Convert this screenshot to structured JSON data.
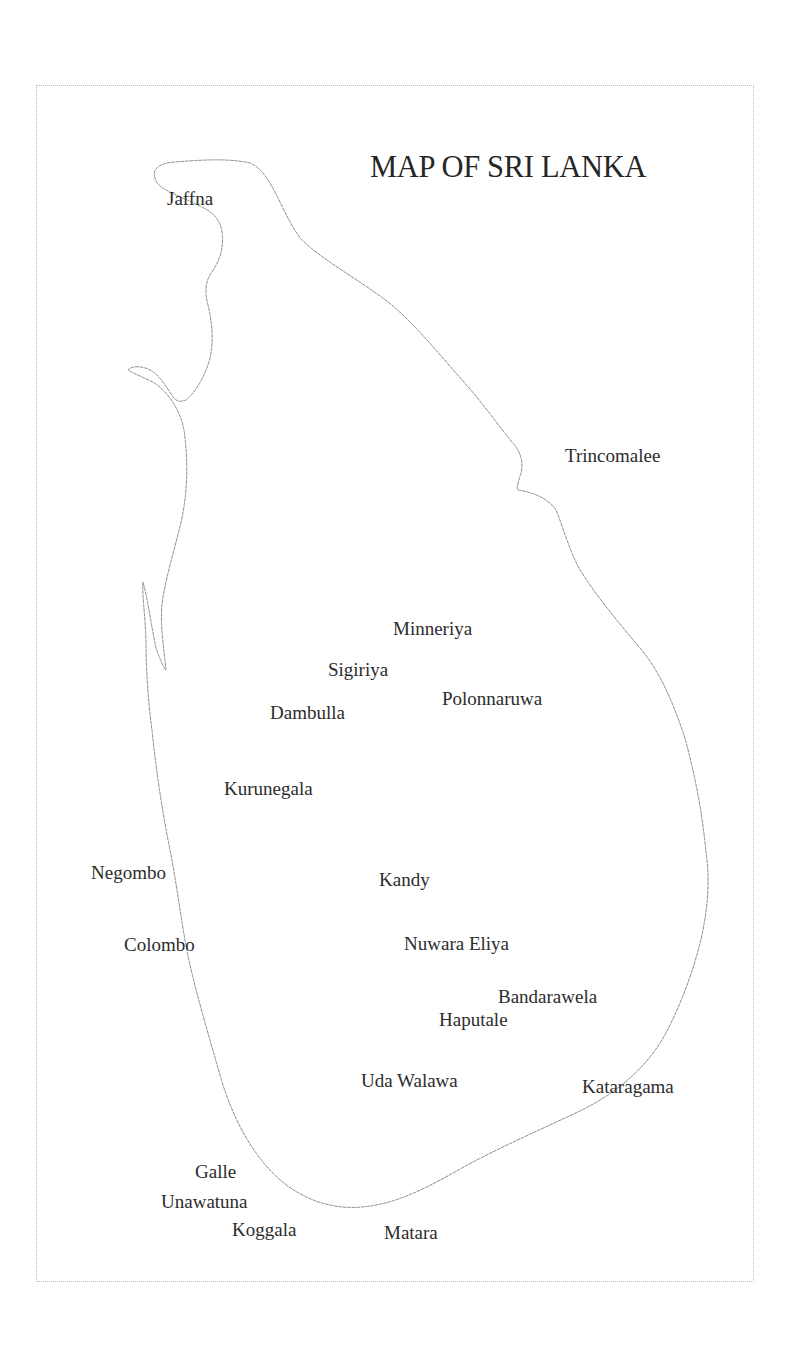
{
  "map": {
    "title": "MAP OF SRI LANKA",
    "colors": {
      "background": "#ffffff",
      "frame": "#b9b9b9",
      "coastline": "#8e8e8e",
      "text": "#2c2c2c"
    },
    "places": [
      {
        "id": "jaffna",
        "name": "Jaffna",
        "x": 167,
        "y": 189
      },
      {
        "id": "trincomalee",
        "name": "Trincomalee",
        "x": 565,
        "y": 446
      },
      {
        "id": "minneriya",
        "name": "Minneriya",
        "x": 393,
        "y": 619
      },
      {
        "id": "sigiriya",
        "name": "Sigiriya",
        "x": 328,
        "y": 660
      },
      {
        "id": "polonnaruwa",
        "name": "Polonnaruwa",
        "x": 442,
        "y": 689
      },
      {
        "id": "dambulla",
        "name": "Dambulla",
        "x": 270,
        "y": 703
      },
      {
        "id": "kurunegala",
        "name": "Kurunegala",
        "x": 224,
        "y": 779
      },
      {
        "id": "negombo",
        "name": "Negombo",
        "x": 91,
        "y": 863
      },
      {
        "id": "kandy",
        "name": "Kandy",
        "x": 379,
        "y": 870
      },
      {
        "id": "colombo",
        "name": "Colombo",
        "x": 124,
        "y": 935
      },
      {
        "id": "nuwara-eliya",
        "name": "Nuwara Eliya",
        "x": 404,
        "y": 934
      },
      {
        "id": "bandarawela",
        "name": "Bandarawela",
        "x": 498,
        "y": 987
      },
      {
        "id": "haputale",
        "name": "Haputale",
        "x": 439,
        "y": 1010
      },
      {
        "id": "uda-walawa",
        "name": "Uda Walawa",
        "x": 361,
        "y": 1071
      },
      {
        "id": "kataragama",
        "name": "Kataragama",
        "x": 582,
        "y": 1077
      },
      {
        "id": "galle",
        "name": "Galle",
        "x": 195,
        "y": 1162
      },
      {
        "id": "unawatuna",
        "name": "Unawatuna",
        "x": 161,
        "y": 1192
      },
      {
        "id": "koggala",
        "name": "Koggala",
        "x": 232,
        "y": 1220
      },
      {
        "id": "matara",
        "name": "Matara",
        "x": 384,
        "y": 1223
      }
    ]
  }
}
